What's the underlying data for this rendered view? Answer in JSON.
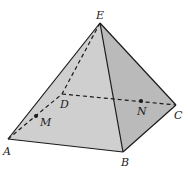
{
  "figure": {
    "type": "square pyramid",
    "colors": {
      "face_front": "#cfcfcf",
      "face_right": "#b9b9b9",
      "face_left": "#c4c4c4",
      "edge": "#1a1a1a"
    },
    "vertices": {
      "E": {
        "label": "E",
        "x": 100,
        "y": 23
      },
      "A": {
        "label": "A",
        "x": 8,
        "y": 139
      },
      "B": {
        "label": "B",
        "x": 123,
        "y": 152
      },
      "C": {
        "label": "C",
        "x": 176,
        "y": 105
      },
      "D": {
        "label": "D",
        "x": 62,
        "y": 94
      }
    },
    "points": {
      "M": {
        "label": "M",
        "x": 36,
        "y": 116
      },
      "N": {
        "label": "N",
        "x": 141,
        "y": 101
      }
    },
    "visible_edges": [
      "EA",
      "EB",
      "EC",
      "AB",
      "BC"
    ],
    "hidden_edges": [
      "ED",
      "AD",
      "DC"
    ]
  }
}
